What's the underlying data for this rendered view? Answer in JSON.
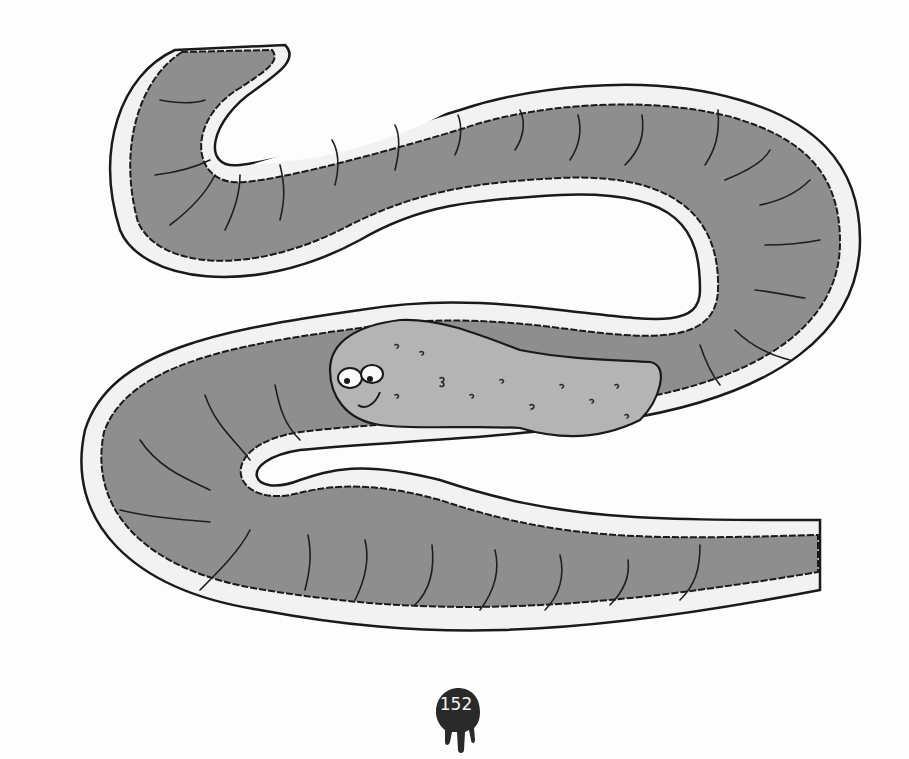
{
  "page": {
    "number": "152",
    "illustration": "cartoon intestine tube with smiling food/poop character",
    "colors": {
      "background": "#fdfdfd",
      "intestine_fill": "#8e8e8e",
      "lining": "#f0f0f0",
      "outline": "#1a1a1a",
      "character_fill": "#b4b4b4",
      "badge": "#2a2a2a"
    }
  }
}
